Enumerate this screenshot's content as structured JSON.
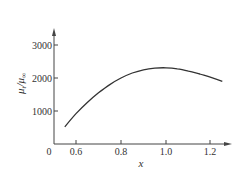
{
  "chart_data": {
    "type": "line",
    "title": "",
    "xlabel": "x",
    "ylabel": "μt/μ∞",
    "xlim": [
      0.5,
      1.28
    ],
    "ylim": [
      0,
      3400
    ],
    "origin_label": "0",
    "x_ticks": [
      0.6,
      0.8,
      1.0,
      1.2
    ],
    "x_tick_labels": [
      "0.6",
      "0.8",
      "1.0",
      "1.2"
    ],
    "y_ticks": [
      1000,
      2000,
      3000
    ],
    "y_tick_labels": [
      "1000",
      "2000",
      "3000"
    ],
    "grid": false,
    "legend": null,
    "series": [
      {
        "name": "μt/μ∞",
        "color": "#333333",
        "x": [
          0.55,
          0.6,
          0.65,
          0.7,
          0.75,
          0.8,
          0.85,
          0.9,
          0.95,
          1.0,
          1.05,
          1.1,
          1.15,
          1.2,
          1.25
        ],
        "y": [
          520,
          920,
          1260,
          1550,
          1800,
          2000,
          2150,
          2250,
          2300,
          2310,
          2280,
          2210,
          2120,
          2020,
          1900
        ]
      }
    ]
  },
  "labels": {
    "origin": "0",
    "xlabel": "x",
    "ylabel_main": "μ",
    "ylabel_sub1": "t",
    "ylabel_slash": "/",
    "ylabel_sub2": "∞",
    "xticks": [
      "0.6",
      "0.8",
      "1.0",
      "1.2"
    ],
    "yticks": [
      "1000",
      "2000",
      "3000"
    ]
  }
}
